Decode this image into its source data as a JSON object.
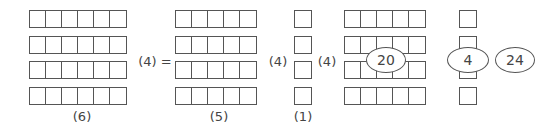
{
  "diagram": {
    "grids": [
      {
        "id": "grid-6x4",
        "cols": 6,
        "rows": 4,
        "x": 29,
        "y": 10,
        "label": "(6)"
      },
      {
        "id": "grid-5x4-a",
        "cols": 5,
        "rows": 4,
        "x": 175,
        "y": 10,
        "label": "(5)"
      },
      {
        "id": "grid-1x4-a",
        "cols": 1,
        "rows": 4,
        "x": 294,
        "y": 10,
        "label": "(1)"
      },
      {
        "id": "grid-5x4-b",
        "cols": 5,
        "rows": 4,
        "x": 344,
        "y": 10,
        "label": ""
      },
      {
        "id": "grid-1x4-b",
        "cols": 1,
        "rows": 4,
        "x": 459,
        "y": 10,
        "label": ""
      }
    ],
    "operators": [
      {
        "text": "(4) =",
        "x": 155,
        "y": 60
      },
      {
        "text": "(4)",
        "x": 277,
        "y": 60
      },
      {
        "text": "(4)",
        "x": 327,
        "y": 60
      }
    ],
    "bottom_labels": [
      {
        "text": "(6)",
        "x": 82,
        "y": 116
      },
      {
        "text": "(5)",
        "x": 219,
        "y": 116
      },
      {
        "text": "(1)",
        "x": 303,
        "y": 116
      }
    ],
    "ellipses": [
      {
        "text": "20",
        "x": 386,
        "y": 60,
        "w": 38,
        "h": 24
      },
      {
        "text": "4",
        "x": 468,
        "y": 60,
        "w": 40,
        "h": 24
      },
      {
        "text": "24",
        "x": 515,
        "y": 60,
        "w": 38,
        "h": 24
      }
    ]
  },
  "text": {
    "op0": "(4) =",
    "op1": "(4)",
    "op2": "(4)",
    "lbl0": "(6)",
    "lbl1": "(5)",
    "lbl2": "(1)",
    "e0": "20",
    "e1": "4",
    "e2": "24"
  }
}
